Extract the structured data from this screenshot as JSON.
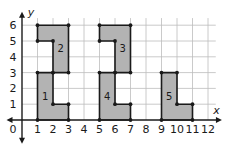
{
  "diagram": {
    "type": "coordinate-grid-figures",
    "axes": {
      "x_label": "x",
      "y_label": "y",
      "x_ticks": [
        "0",
        "1",
        "2",
        "3",
        "4",
        "5",
        "6",
        "7",
        "8",
        "9",
        "10",
        "11",
        "12"
      ],
      "y_ticks": [
        "1",
        "2",
        "3",
        "4",
        "5",
        "6"
      ],
      "x_range": [
        0,
        12
      ],
      "y_range": [
        0,
        6.5
      ],
      "grid": true
    },
    "colors": {
      "fill": "#b3b3b3",
      "grid": "#bdbdbd",
      "outline": "#1a1a1a"
    },
    "shapes": [
      {
        "label": "1",
        "vertices": [
          [
            1,
            0
          ],
          [
            1,
            3
          ],
          [
            2,
            3
          ],
          [
            2,
            1
          ],
          [
            3,
            1
          ],
          [
            3,
            0
          ]
        ],
        "label_pos": [
          1.5,
          1.5
        ]
      },
      {
        "label": "2",
        "vertices": [
          [
            1,
            5
          ],
          [
            1,
            6
          ],
          [
            3,
            6
          ],
          [
            3,
            3
          ],
          [
            2,
            3
          ],
          [
            2,
            5
          ]
        ],
        "label_pos": [
          2.5,
          4.5
        ]
      },
      {
        "label": "3",
        "vertices": [
          [
            5,
            5
          ],
          [
            5,
            6
          ],
          [
            7,
            6
          ],
          [
            7,
            3
          ],
          [
            6,
            3
          ],
          [
            6,
            5
          ]
        ],
        "label_pos": [
          6.5,
          4.5
        ]
      },
      {
        "label": "4",
        "vertices": [
          [
            5,
            0
          ],
          [
            5,
            3
          ],
          [
            6,
            3
          ],
          [
            6,
            1
          ],
          [
            7,
            1
          ],
          [
            7,
            0
          ]
        ],
        "label_pos": [
          5.5,
          1.5
        ]
      },
      {
        "label": "5",
        "vertices": [
          [
            9,
            0
          ],
          [
            9,
            3
          ],
          [
            10,
            3
          ],
          [
            10,
            1
          ],
          [
            11,
            1
          ],
          [
            11,
            0
          ]
        ],
        "label_pos": [
          9.5,
          1.5
        ]
      }
    ]
  }
}
